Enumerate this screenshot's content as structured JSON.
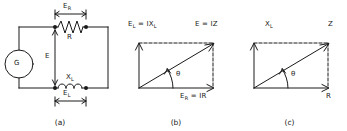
{
  "figure": {
    "type": "electrical-circuit-and-phasor-diagram",
    "stroke_color": "#1a1a1a",
    "panel_count": 3
  },
  "panel_a": {
    "caption": "(a)",
    "source_label": "G",
    "source_type": "generator",
    "voltage_label": "E",
    "resistor_label": "R",
    "inductor_label": "X",
    "inductor_sub": "L",
    "dim_top_label": "E",
    "dim_top_sub": "R",
    "dim_bottom_label": "E",
    "dim_bottom_sub": "L"
  },
  "panel_b": {
    "caption": "(b)",
    "vertical_label": "E",
    "vertical_sub": "L",
    "vertical_eq": " = IX",
    "vertical_eq_sub": "L",
    "hyp_label": "E",
    "hyp_eq": " = IZ",
    "horiz_label": "E",
    "horiz_sub": "R",
    "horiz_eq": " = IR",
    "angle_label": "θ"
  },
  "panel_c": {
    "caption": "(c)",
    "vertical_label": "X",
    "vertical_sub": "L",
    "hyp_label": "Z",
    "horiz_label": "R",
    "angle_label": "θ"
  }
}
